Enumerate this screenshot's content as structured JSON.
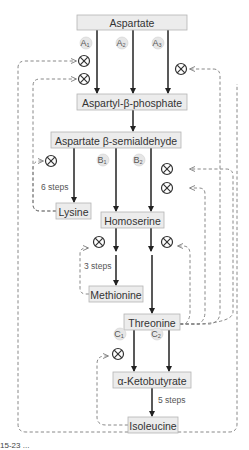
{
  "diagram": {
    "nodes": {
      "aspartate": "Aspartate",
      "aspartyl_phosphate": "Aspartyl-β-phosphate",
      "aspartate_semialdehyde": "Aspartate β-semialdehyde",
      "lysine": "Lysine",
      "homoserine": "Homoserine",
      "methionine": "Methionine",
      "threonine": "Threonine",
      "ketobutyrate": "α-Ketobutyrate",
      "isoleucine": "Isoleucine"
    },
    "enzymes": {
      "a1": {
        "letter": "A",
        "sub": "1"
      },
      "a2": {
        "letter": "A",
        "sub": "2"
      },
      "a3": {
        "letter": "A",
        "sub": "3"
      },
      "b1": {
        "letter": "B",
        "sub": "1"
      },
      "b2": {
        "letter": "B",
        "sub": "2"
      },
      "c1": {
        "letter": "C",
        "sub": "1"
      },
      "c2": {
        "letter": "C",
        "sub": "2"
      }
    },
    "step_labels": {
      "lysine_steps": "6 steps",
      "methionine_steps": "3 steps",
      "isoleucine_steps": "5 steps"
    },
    "icons": {
      "inhibition": "inhibition-icon (circled X)",
      "flow_arrow": "solid-arrow",
      "feedback_arrow": "dashed-arrow"
    },
    "colors": {
      "box_fill": "#ececec",
      "box_stroke": "#b5b5b5",
      "flow": "#222222",
      "feedback": "#7a7a7a",
      "enzyme_fill": "#e6e6e6"
    }
  },
  "caption": {
    "text": "15-23  ..."
  }
}
